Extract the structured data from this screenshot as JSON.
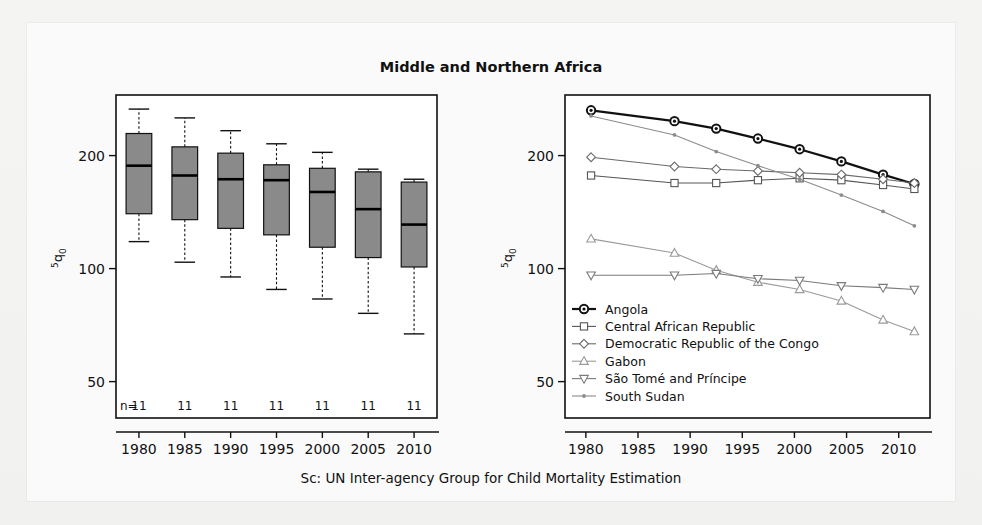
{
  "figure": {
    "title": "Middle and Northern Africa",
    "caption": "Sc: UN Inter-agency Group for Child Mortality Estimation",
    "y_axis_label": "5q0",
    "background_color": "#f2f2f0",
    "box_fill_color": "#8a8a8a",
    "axis_color": "#111111"
  },
  "chart_data": [
    {
      "type": "box",
      "panel": "left",
      "title": "Middle and Northern Africa",
      "xlabel": "",
      "ylabel": "5q0",
      "yscale": "log",
      "ylim": [
        40,
        290
      ],
      "yticks": [
        50,
        100,
        200
      ],
      "ytick_labels": [
        "50",
        "100",
        "200"
      ],
      "grid": false,
      "categories": [
        "1980",
        "1985",
        "1990",
        "1995",
        "2000",
        "2005",
        "2010"
      ],
      "counts_prefix": "n=",
      "counts": [
        11,
        11,
        11,
        11,
        11,
        11,
        11
      ],
      "boxes": [
        {
          "category": "1980",
          "whisker_low": 118,
          "q1": 140,
          "median": 188,
          "q3": 229,
          "whisker_high": 266
        },
        {
          "category": "1985",
          "whisker_low": 104,
          "q1": 135,
          "median": 177,
          "q3": 211,
          "whisker_high": 252
        },
        {
          "category": "1990",
          "whisker_low": 95,
          "q1": 128,
          "median": 173,
          "q3": 203,
          "whisker_high": 233
        },
        {
          "category": "1995",
          "whisker_low": 88,
          "q1": 123,
          "median": 172,
          "q3": 189,
          "whisker_high": 215
        },
        {
          "category": "2000",
          "whisker_low": 83,
          "q1": 114,
          "median": 160,
          "q3": 185,
          "whisker_high": 204
        },
        {
          "category": "2005",
          "whisker_low": 76,
          "q1": 107,
          "median": 144,
          "q3": 181,
          "whisker_high": 184
        },
        {
          "category": "2010",
          "whisker_low": 67,
          "q1": 101,
          "median": 131,
          "q3": 170,
          "whisker_high": 173
        }
      ]
    },
    {
      "type": "line",
      "panel": "right",
      "xlabel": "",
      "ylabel": "5q0",
      "yscale": "log",
      "ylim": [
        40,
        290
      ],
      "yticks": [
        50,
        100,
        200
      ],
      "ytick_labels": [
        "50",
        "100",
        "200"
      ],
      "xlim": [
        1978,
        2013
      ],
      "xticks": [
        1980,
        1985,
        1990,
        1995,
        2000,
        2005,
        2010
      ],
      "xtick_labels": [
        "1980",
        "1985",
        "1990",
        "1995",
        "2000",
        "2005",
        "2010"
      ],
      "grid": false,
      "legend_position": "bottom-left",
      "series": [
        {
          "name": "Angola",
          "marker": "circle-filled",
          "color": "#111111",
          "linewidth": 2.2,
          "x": [
            1980.5,
            1988.5,
            1992.5,
            1996.5,
            2000.5,
            2004.5,
            2008.5,
            2011.5
          ],
          "values": [
            264,
            247,
            236,
            222,
            208,
            193,
            178,
            168
          ]
        },
        {
          "name": "Central African Republic",
          "marker": "square",
          "color": "#555555",
          "linewidth": 1.1,
          "x": [
            1980.5,
            1988.5,
            1992.5,
            1996.5,
            2000.5,
            2004.5,
            2008.5,
            2011.5
          ],
          "values": [
            177,
            169,
            169,
            172,
            174,
            172,
            167,
            163
          ]
        },
        {
          "name": "Democratic Republic of the Congo",
          "marker": "diamond",
          "color": "#6a6a6a",
          "linewidth": 1.1,
          "x": [
            1980.5,
            1988.5,
            1992.5,
            1996.5,
            2000.5,
            2004.5,
            2008.5,
            2011.5
          ],
          "values": [
            198,
            187,
            184,
            182,
            180,
            178,
            173,
            169
          ]
        },
        {
          "name": "Gabon",
          "marker": "triangle-up",
          "color": "#9a9a9a",
          "linewidth": 1.1,
          "x": [
            1980.5,
            1988.5,
            1992.5,
            1996.5,
            2000.5,
            2004.5,
            2008.5,
            2011.5
          ],
          "values": [
            120,
            110,
            99,
            92,
            88,
            82,
            73,
            68
          ]
        },
        {
          "name": "São Tomé and Príncipe",
          "marker": "triangle-down",
          "color": "#7a7a7a",
          "linewidth": 1.1,
          "x": [
            1980.5,
            1988.5,
            1992.5,
            1996.5,
            2000.5,
            2004.5,
            2008.5,
            2011.5
          ],
          "values": [
            96,
            96,
            97,
            94,
            93,
            90,
            89,
            88
          ]
        },
        {
          "name": "South Sudan",
          "marker": "dot-small",
          "color": "#8c8c8c",
          "linewidth": 1.1,
          "x": [
            1980.5,
            1988.5,
            1992.5,
            1996.5,
            2000.5,
            2004.5,
            2008.5,
            2011.5
          ],
          "values": [
            255,
            227,
            205,
            188,
            173,
            157,
            142,
            130
          ]
        }
      ]
    }
  ]
}
